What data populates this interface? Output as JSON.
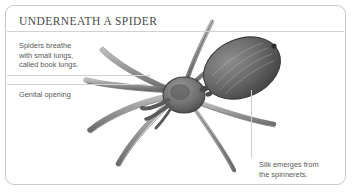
{
  "card": {
    "title": "UNDERNEATH A SPIDER",
    "border_color": "#c9c9c9",
    "background_color": "#ffffff",
    "title_color": "#4a4a4a",
    "label_color": "#58585a",
    "rule_color": "#d2d2d2"
  },
  "labels": {
    "lungs": "Spiders breathe\nwith small lungs,\ncalled book lungs.",
    "genital": "Genital opening",
    "silk": "Silk emerges from\nthe spinnerets."
  },
  "illustration": {
    "subject": "spider-underside-illustration",
    "style": "grayscale pencil engraving",
    "ink_color": "#6b6b6b"
  }
}
